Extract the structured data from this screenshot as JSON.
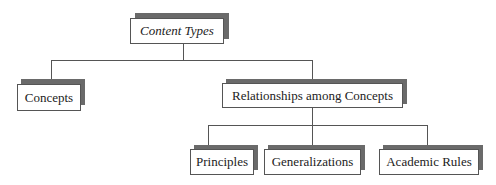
{
  "diagram": {
    "type": "hierarchy",
    "root": {
      "label": "Content Types"
    },
    "level1": [
      {
        "label": "Concepts"
      },
      {
        "label": "Relationships among Concepts"
      }
    ],
    "level2": [
      {
        "label": "Principles"
      },
      {
        "label": "Generalizations"
      },
      {
        "label": "Academic Rules"
      }
    ]
  }
}
